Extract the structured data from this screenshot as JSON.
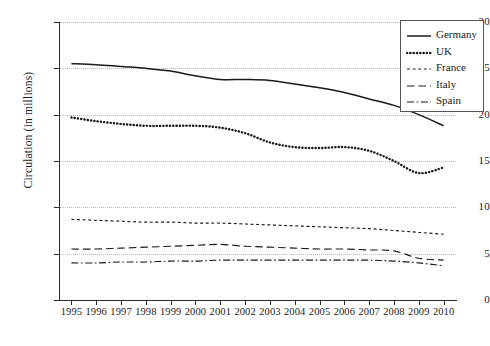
{
  "chart_data": {
    "type": "line",
    "title": "",
    "xlabel": "",
    "ylabel": "Circulation (in millions)",
    "x": [
      1995,
      1996,
      1997,
      1998,
      1999,
      2000,
      2001,
      2002,
      2003,
      2004,
      2005,
      2006,
      2007,
      2008,
      2009,
      2010
    ],
    "xlim": [
      1994.5,
      2010.5
    ],
    "ylim": [
      0,
      30
    ],
    "yticks": [
      0,
      5,
      10,
      15,
      20,
      25,
      30
    ],
    "xticks": [
      "1995",
      "1996",
      "1997",
      "1998",
      "1999",
      "2000",
      "2001",
      "2002",
      "2003",
      "2004",
      "2005",
      "2006",
      "2007",
      "2008",
      "2009",
      "2010"
    ],
    "grid": "horizontal-dotted",
    "legend_position": "top-right",
    "series": [
      {
        "name": "Germany",
        "style": "solid",
        "values": [
          25.5,
          25.4,
          25.2,
          25.0,
          24.7,
          24.2,
          23.8,
          23.8,
          23.7,
          23.3,
          22.9,
          22.4,
          21.7,
          21.0,
          20.0,
          18.8
        ]
      },
      {
        "name": "UK",
        "style": "dotted",
        "values": [
          19.7,
          19.3,
          19.0,
          18.8,
          18.8,
          18.8,
          18.6,
          18.0,
          17.0,
          16.5,
          16.4,
          16.5,
          16.1,
          15.0,
          13.7,
          14.3
        ]
      },
      {
        "name": "France",
        "style": "dashed-small",
        "values": [
          8.7,
          8.6,
          8.5,
          8.4,
          8.4,
          8.3,
          8.3,
          8.2,
          8.1,
          8.0,
          7.9,
          7.8,
          7.7,
          7.5,
          7.3,
          7.1
        ]
      },
      {
        "name": "Italy",
        "style": "dashed-long",
        "values": [
          5.5,
          5.5,
          5.6,
          5.7,
          5.8,
          5.9,
          6.0,
          5.8,
          5.7,
          5.6,
          5.5,
          5.5,
          5.4,
          5.3,
          4.5,
          4.3
        ]
      },
      {
        "name": "Spain",
        "style": "dash-dot",
        "values": [
          4.0,
          4.0,
          4.1,
          4.1,
          4.2,
          4.2,
          4.3,
          4.3,
          4.3,
          4.3,
          4.3,
          4.3,
          4.3,
          4.2,
          4.0,
          3.7
        ]
      }
    ]
  },
  "legend": {
    "items": [
      {
        "label": "Germany",
        "style": "solid"
      },
      {
        "label": "UK",
        "style": "dotted"
      },
      {
        "label": "France",
        "style": "dashed-small"
      },
      {
        "label": "Italy",
        "style": "dashed-long"
      },
      {
        "label": "Spain",
        "style": "dash-dot"
      }
    ]
  },
  "colors": {
    "line": "#1a1a1a",
    "axis": "#2b2b2b",
    "grid": "#bdbdbd",
    "background": "#ffffff"
  }
}
